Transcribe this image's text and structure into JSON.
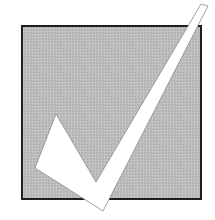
{
  "icon": {
    "name": "checkbox-checked-icon",
    "colors": {
      "background": "#ffffff",
      "box_fill": "#b9b9b9",
      "box_border": "#1e1e1e",
      "check_fill": "#ffffff",
      "check_stroke": "#8a8a8a"
    },
    "box": {
      "x": 22,
      "y": 26,
      "width": 179,
      "height": 173
    },
    "check_points": "56,114 35,168 103,211 208,6 201,4 96,182"
  }
}
